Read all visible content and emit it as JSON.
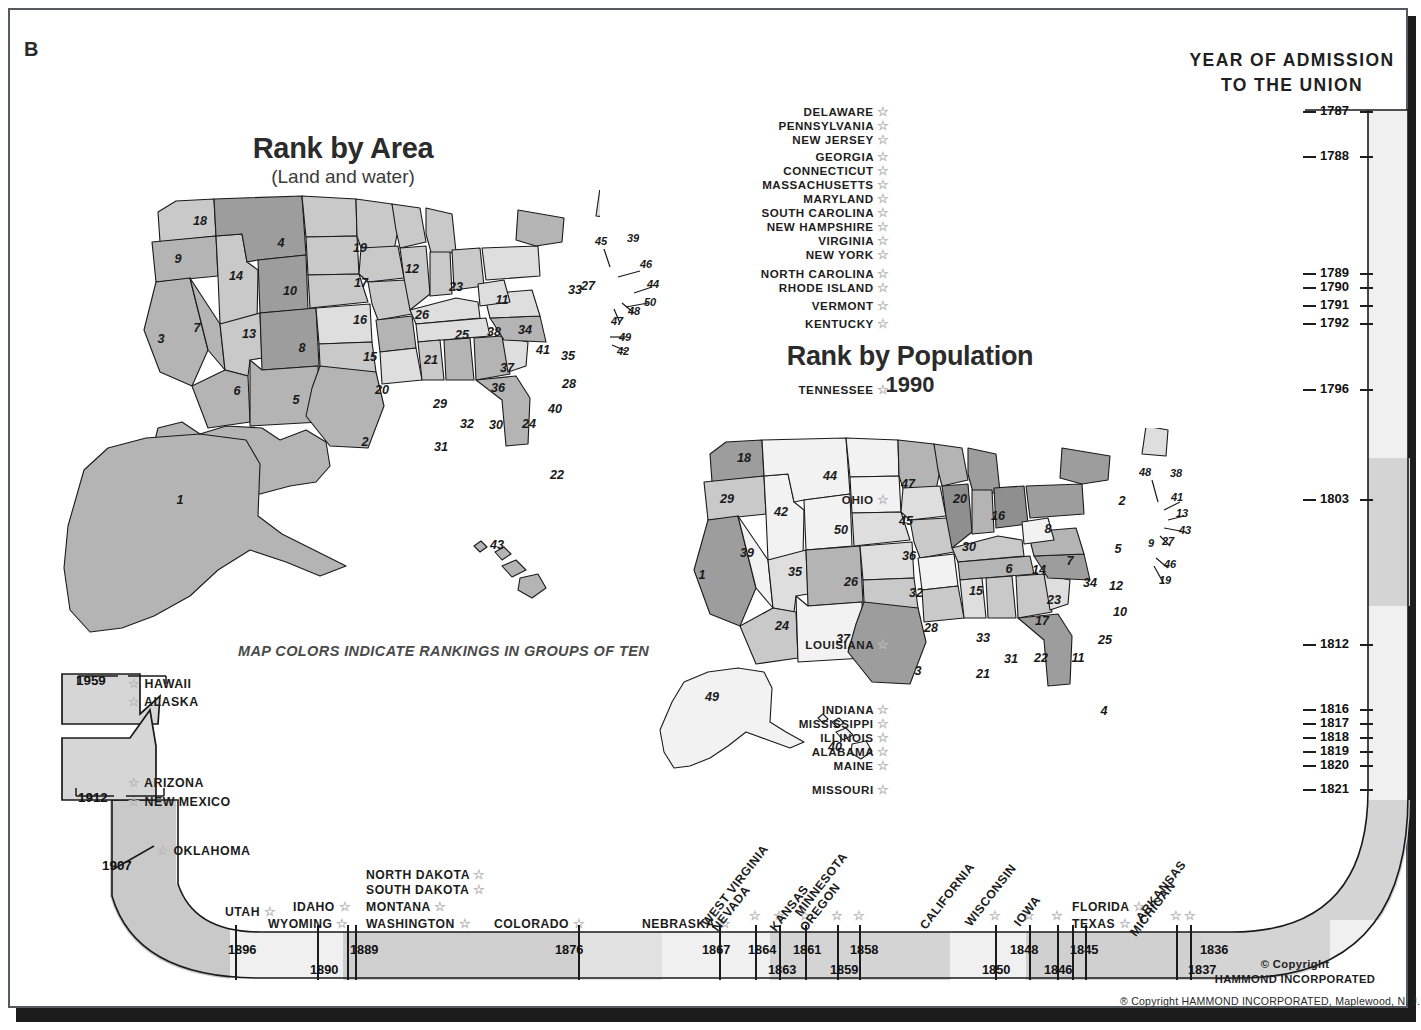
{
  "plate": {
    "corner_label": "B"
  },
  "maps": {
    "area": {
      "title": "Rank by Area",
      "subtitle": "(Land and water)"
    },
    "population": {
      "title": "Rank by Population",
      "subtitle": "1990"
    },
    "legend_note": "MAP COLORS INDICATE RANKINGS IN GROUPS OF TEN"
  },
  "union_panel": {
    "heading_line1": "YEAR OF ADMISSION",
    "heading_line2": "TO THE UNION"
  },
  "copyright": {
    "mark": "© Copyright",
    "company": "HAMMOND INCORPORATED",
    "footer": "® Copyright  HAMMOND  INCORPORATED, Maplewood, N. J."
  },
  "chart_data": {
    "type": "map",
    "maps": [
      {
        "name": "Rank by Area",
        "subtitle": "(Land and water)",
        "note": "Map colors indicate rankings in groups of ten",
        "ranks": {
          "Alaska": 1,
          "Texas": 2,
          "California": 3,
          "Montana": 4,
          "New Mexico": 5,
          "Arizona": 6,
          "Nevada": 7,
          "Colorado": 8,
          "Oregon": 9,
          "Wyoming": 10,
          "Michigan": 11,
          "Minnesota": 12,
          "Utah": 13,
          "Idaho": 14,
          "Kansas": 15,
          "Nebraska": 16,
          "South Dakota": 17,
          "Washington": 18,
          "North Dakota": 19,
          "Oklahoma": 20,
          "Missouri": 21,
          "Florida": 22,
          "Wisconsin": 23,
          "Georgia": 24,
          "Illinois": 25,
          "Iowa": 26,
          "New York": 27,
          "North Carolina": 28,
          "Arkansas": 29,
          "Alabama": 30,
          "Louisiana": 31,
          "Mississippi": 32,
          "Pennsylvania": 33,
          "Ohio": 34,
          "Virginia": 35,
          "Tennessee": 36,
          "Kentucky": 37,
          "Indiana": 38,
          "Maine": 39,
          "South Carolina": 40,
          "West Virginia": 41,
          "Maryland": 42,
          "Hawaii": 43,
          "Massachusetts": 44,
          "Vermont": 45,
          "New Hampshire": 46,
          "New Jersey": 47,
          "Connecticut": 48,
          "Delaware": 49,
          "Rhode Island": 50
        }
      },
      {
        "name": "Rank by Population",
        "subtitle": "1990",
        "ranks": {
          "California": 1,
          "New York": 2,
          "Texas": 3,
          "Florida": 4,
          "Pennsylvania": 5,
          "Illinois": 6,
          "Ohio": 7,
          "Michigan": 8,
          "New Jersey": 9,
          "North Carolina": 10,
          "Georgia": 11,
          "Virginia": 12,
          "Massachusetts": 13,
          "Indiana": 14,
          "Missouri": 15,
          "Wisconsin": 16,
          "Tennessee": 17,
          "Washington": 18,
          "Maryland": 19,
          "Minnesota": 20,
          "Louisiana": 21,
          "Alabama": 22,
          "Kentucky": 23,
          "Arizona": 24,
          "South Carolina": 25,
          "Colorado": 26,
          "Connecticut": 27,
          "Oklahoma": 28,
          "Oregon": 29,
          "Iowa": 30,
          "Mississippi": 31,
          "Kansas": 32,
          "Arkansas": 33,
          "West Virginia": 34,
          "Utah": 35,
          "Nebraska": 36,
          "New Mexico": 37,
          "Maine": 38,
          "Nevada": 39,
          "Hawaii": 40,
          "New Hampshire": 41,
          "Idaho": 42,
          "Rhode Island": 43,
          "Montana": 44,
          "South Dakota": 45,
          "Delaware": 46,
          "North Dakota": 47,
          "Vermont": 48,
          "Alaska": 49,
          "Wyoming": 50
        }
      }
    ],
    "timeline": {
      "label": "Year of admission to the Union",
      "entries": [
        {
          "state": "DELAWARE",
          "year": 1787,
          "show_year": true
        },
        {
          "state": "PENNSYLVANIA",
          "year": 1787,
          "show_year": false
        },
        {
          "state": "NEW JERSEY",
          "year": 1787,
          "show_year": false
        },
        {
          "state": "GEORGIA",
          "year": 1788,
          "show_year": true
        },
        {
          "state": "CONNECTICUT",
          "year": 1788,
          "show_year": false
        },
        {
          "state": "MASSACHUSETTS",
          "year": 1788,
          "show_year": false
        },
        {
          "state": "MARYLAND",
          "year": 1788,
          "show_year": false
        },
        {
          "state": "SOUTH CAROLINA",
          "year": 1788,
          "show_year": false
        },
        {
          "state": "NEW HAMPSHIRE",
          "year": 1788,
          "show_year": false
        },
        {
          "state": "VIRGINIA",
          "year": 1788,
          "show_year": false
        },
        {
          "state": "NEW YORK",
          "year": 1788,
          "show_year": false
        },
        {
          "state": "NORTH CAROLINA",
          "year": 1789,
          "show_year": true
        },
        {
          "state": "RHODE ISLAND",
          "year": 1790,
          "show_year": true
        },
        {
          "state": "VERMONT",
          "year": 1791,
          "show_year": true
        },
        {
          "state": "KENTUCKY",
          "year": 1792,
          "show_year": true
        },
        {
          "state": "TENNESSEE",
          "year": 1796,
          "show_year": true
        },
        {
          "state": "OHIO",
          "year": 1803,
          "show_year": true
        },
        {
          "state": "LOUISIANA",
          "year": 1812,
          "show_year": true
        },
        {
          "state": "INDIANA",
          "year": 1816,
          "show_year": true
        },
        {
          "state": "MISSISSIPPI",
          "year": 1817,
          "show_year": true
        },
        {
          "state": "ILLINOIS",
          "year": 1818,
          "show_year": true
        },
        {
          "state": "ALABAMA",
          "year": 1819,
          "show_year": true
        },
        {
          "state": "MAINE",
          "year": 1820,
          "show_year": true
        },
        {
          "state": "MISSOURI",
          "year": 1821,
          "show_year": true
        },
        {
          "state": "ARKANSAS",
          "year": 1836,
          "show_year": true
        },
        {
          "state": "MICHIGAN",
          "year": 1837,
          "show_year": true
        },
        {
          "state": "FLORIDA",
          "year": 1845,
          "show_year": true
        },
        {
          "state": "TEXAS",
          "year": 1845,
          "show_year": false
        },
        {
          "state": "IOWA",
          "year": 1846,
          "show_year": true
        },
        {
          "state": "WISCONSIN",
          "year": 1848,
          "show_year": true
        },
        {
          "state": "CALIFORNIA",
          "year": 1850,
          "show_year": true
        },
        {
          "state": "MINNESOTA",
          "year": 1858,
          "show_year": true
        },
        {
          "state": "OREGON",
          "year": 1859,
          "show_year": true
        },
        {
          "state": "KANSAS",
          "year": 1861,
          "show_year": true
        },
        {
          "state": "WEST VIRGINIA",
          "year": 1863,
          "show_year": true
        },
        {
          "state": "NEVADA",
          "year": 1864,
          "show_year": true
        },
        {
          "state": "NEBRASKA",
          "year": 1867,
          "show_year": true
        },
        {
          "state": "COLORADO",
          "year": 1876,
          "show_year": true
        },
        {
          "state": "NORTH DAKOTA",
          "year": 1889,
          "show_year": true
        },
        {
          "state": "SOUTH DAKOTA",
          "year": 1889,
          "show_year": false
        },
        {
          "state": "MONTANA",
          "year": 1889,
          "show_year": false
        },
        {
          "state": "WASHINGTON",
          "year": 1889,
          "show_year": false
        },
        {
          "state": "IDAHO",
          "year": 1890,
          "show_year": true
        },
        {
          "state": "WYOMING",
          "year": 1890,
          "show_year": false
        },
        {
          "state": "UTAH",
          "year": 1896,
          "show_year": true
        },
        {
          "state": "OKLAHOMA",
          "year": 1907,
          "show_year": true
        },
        {
          "state": "ARIZONA",
          "year": 1912,
          "show_year": true
        },
        {
          "state": "NEW MEXICO",
          "year": 1912,
          "show_year": false
        },
        {
          "state": "ALASKA",
          "year": 1959,
          "show_year": true
        },
        {
          "state": "HAWAII",
          "year": 1959,
          "show_year": false
        }
      ]
    }
  },
  "union_rows_vertical": [
    {
      "name": "DELAWARE",
      "year": "1787"
    },
    {
      "name": "PENNSYLVANIA",
      "year": ""
    },
    {
      "name": "NEW JERSEY",
      "year": ""
    },
    {
      "name": "GEORGIA",
      "year": "1788"
    },
    {
      "name": "CONNECTICUT",
      "year": ""
    },
    {
      "name": "MASSACHUSETTS",
      "year": ""
    },
    {
      "name": "MARYLAND",
      "year": ""
    },
    {
      "name": "SOUTH CAROLINA",
      "year": ""
    },
    {
      "name": "NEW HAMPSHIRE",
      "year": ""
    },
    {
      "name": "VIRGINIA",
      "year": ""
    },
    {
      "name": "NEW YORK",
      "year": ""
    },
    {
      "name": "NORTH CAROLINA",
      "year": "1789"
    },
    {
      "name": "RHODE ISLAND",
      "year": "1790"
    },
    {
      "name": "VERMONT",
      "year": "1791"
    },
    {
      "name": "KENTUCKY",
      "year": "1792"
    },
    {
      "name": "TENNESSEE",
      "year": "1796"
    },
    {
      "name": "OHIO",
      "year": "1803"
    },
    {
      "name": "LOUISIANA",
      "year": "1812"
    },
    {
      "name": "INDIANA",
      "year": "1816"
    },
    {
      "name": "MISSISSIPPI",
      "year": "1817"
    },
    {
      "name": "ILLINOIS",
      "year": "1818"
    },
    {
      "name": "ALABAMA",
      "year": "1819"
    },
    {
      "name": "MAINE",
      "year": "1820"
    },
    {
      "name": "MISSOURI",
      "year": "1821"
    }
  ],
  "notch_labels": {
    "y1959": "1959",
    "hawaii": "HAWAII",
    "alaska": "ALASKA",
    "y1912": "1912",
    "arizona": "ARIZONA",
    "new_mexico": "NEW MEXICO",
    "y1907": "1907",
    "oklahoma": "OKLAHOMA"
  },
  "bottom_rows": [
    {
      "name": "UTAH",
      "year": "1896"
    },
    {
      "name": "WYOMING",
      "year": "1890"
    },
    {
      "name": "IDAHO",
      "year": ""
    },
    {
      "name": "NORTH DAKOTA",
      "year": "1889"
    },
    {
      "name": "SOUTH DAKOTA",
      "year": ""
    },
    {
      "name": "MONTANA",
      "year": ""
    },
    {
      "name": "WASHINGTON",
      "year": ""
    },
    {
      "name": "COLORADO",
      "year": "1876"
    },
    {
      "name": "NEBRASKA",
      "year": "1867"
    },
    {
      "name": "WEST VIRGINIA",
      "year": "1863"
    },
    {
      "name": "NEVADA",
      "year": "1864"
    },
    {
      "name": "KANSAS",
      "year": "1861"
    },
    {
      "name": "OREGON",
      "year": "1859"
    },
    {
      "name": "MINNESOTA",
      "year": "1858"
    },
    {
      "name": "CALIFORNIA",
      "year": "1850"
    },
    {
      "name": "WISCONSIN",
      "year": "1848"
    },
    {
      "name": "IOWA",
      "year": "1846"
    },
    {
      "name": "FLORIDA",
      "year": "1845"
    },
    {
      "name": "TEXAS",
      "year": ""
    },
    {
      "name": "ARKANSAS",
      "year": "1836"
    },
    {
      "name": "MICHIGAN",
      "year": "1837"
    }
  ],
  "colors": {
    "tier1": "#9d9d9d",
    "tier2": "#b4b4b4",
    "tier3": "#c9c9c9",
    "tier4": "#dedede",
    "tier5": "#f2f2f2",
    "ribbon_light": "#eeeeee",
    "ribbon_dark": "#cdcdcd",
    "outline": "#1a1a1a",
    "frame": "#555a5f",
    "shadow": "#1c1c1c"
  }
}
